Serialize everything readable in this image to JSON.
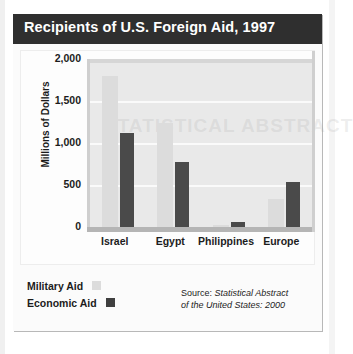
{
  "figure": {
    "title": "Recipients of U.S. Foreign Aid, 1997",
    "watermark": "STATISTICAL ABSTRACT",
    "source_prefix": "Source: ",
    "source_italic_line1": "Statistical Abstract",
    "source_italic_line2": "of the United States: 2000"
  },
  "legend": {
    "items": [
      {
        "label": "Military Aid",
        "color": "#dcdcdc"
      },
      {
        "label": "Economic Aid",
        "color": "#3f3f3f"
      }
    ]
  },
  "chart_data": {
    "type": "bar",
    "title": "Recipients of U.S. Foreign Aid, 1997",
    "xlabel": "",
    "ylabel": "Millions of Dollars",
    "categories": [
      "Israel",
      "Egypt",
      "Philippines",
      "Europe"
    ],
    "series": [
      {
        "name": "Military Aid",
        "color": "#dcdcdc",
        "values": [
          1800,
          1240,
          20,
          330
        ]
      },
      {
        "name": "Economic Aid",
        "color": "#4a4a4a",
        "values": [
          1120,
          775,
          65,
          540
        ]
      }
    ],
    "ylim": [
      0,
      2000
    ],
    "yticks": [
      0,
      500,
      1000,
      1500,
      2000
    ],
    "ytick_labels": [
      "0",
      "500",
      "1,000",
      "1,500",
      "2,000"
    ],
    "grid": true,
    "legend_position": "bottom-left",
    "source": "Source: Statistical Abstract of the United States: 2000"
  }
}
